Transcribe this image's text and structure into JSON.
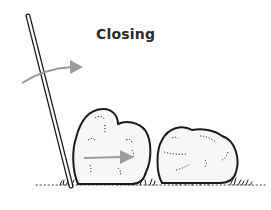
{
  "diagram": {
    "title": "Closing",
    "elements": [
      {
        "name": "pole",
        "description": "leaning stake/pole"
      },
      {
        "name": "rotation-arrow",
        "description": "curved gray arrow pointing right at top of pole"
      },
      {
        "name": "left-shrub",
        "description": "shrub against the pole"
      },
      {
        "name": "push-arrow",
        "description": "gray arrow pointing right inside left shrub"
      },
      {
        "name": "right-shrub",
        "description": "second shrub to the right"
      },
      {
        "name": "ground",
        "description": "grass ground line"
      }
    ],
    "colors": {
      "ink": "#1a1a1a",
      "arrow": "#9b9b9b",
      "background": "#ffffff"
    }
  }
}
